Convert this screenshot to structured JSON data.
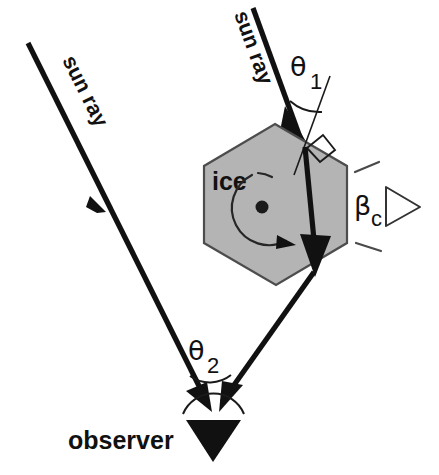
{
  "figure": {
    "title": "Sun ray refraction through a hexagonal ice crystal toward an observer",
    "background_color": "#ffffff",
    "ink_color": "#111111",
    "crystal_fill_color": "#b4b4b4",
    "crystal_edge_color": "#4d4d4d"
  },
  "labels": {
    "sun_ray_left": "sun ray",
    "sun_ray_right": "sun ray",
    "ice": "ice",
    "observer": "observer",
    "theta1_symbol": "θ",
    "theta1_subscript": "1",
    "theta2_symbol": "θ",
    "theta2_subscript": "2",
    "beta_symbol": "β",
    "beta_subscript": "c"
  },
  "elements": {
    "incident_ray_name": "incident-sun-ray",
    "second_ray_name": "direct-sun-ray",
    "refracted_ray_name": "refracted-ray",
    "exit_ray_name": "exit-ray-to-observer",
    "crystal_name": "hexagonal-ice-crystal",
    "rotation_name": "crystal-rotation-arrow",
    "observer_name": "observer-eye",
    "normal_name": "surface-normal",
    "right_angle_name": "right-angle-marker",
    "theta1_arc_name": "theta1-angle-arc",
    "theta2_arc_name": "theta2-angle-arc",
    "beta_wedge_name": "beta-c-angle-wedge"
  },
  "geometry": {
    "hexagon_points": "275,124 347,166 347,243 276,285 204,243 204,166",
    "crystal_center": {
      "x": 262,
      "y": 207
    },
    "entry_point": {
      "x": 306,
      "y": 149
    },
    "exit_point": {
      "x": 316,
      "y": 278
    },
    "observer_point": {
      "x": 213,
      "y": 412
    },
    "theta1_degrees": 1,
    "theta2_degrees": 2
  }
}
